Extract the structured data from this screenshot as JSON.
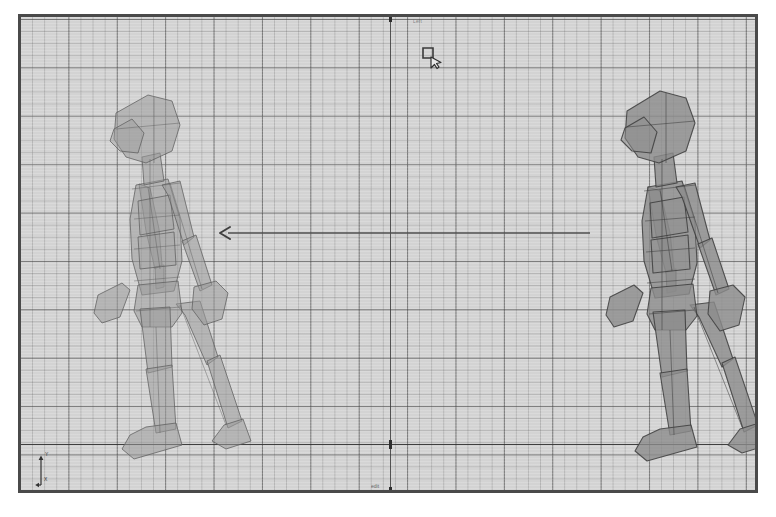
{
  "application": {
    "type": "3d-animation-viewport",
    "view_name": "Left",
    "projection": "orthographic-side"
  },
  "viewport": {
    "label_top": "Left",
    "status_label": "edit",
    "background_color": "#d5d5d5",
    "border_color": "#4a4a4a",
    "grid": {
      "minor_spacing_px": 12,
      "major_spacing_px": 48,
      "minor_color": "#6e6e6e",
      "major_color": "#464646",
      "visible": true
    },
    "axes": {
      "vertical_line_color": "#3b3b3b",
      "ground_line_color": "#2f2f2f",
      "vertical_x_px": 390,
      "ground_y_px": 444
    }
  },
  "gizmo": {
    "name": "axis-orientation-gizmo",
    "axis_y_label": "Y",
    "axis_x_label": "X",
    "color": "#333333"
  },
  "cursor": {
    "name": "lasso-select-cursor",
    "x_px": 420,
    "y_px": 45
  },
  "annotation": {
    "arrow": {
      "name": "motion-direction-arrow",
      "direction": "left",
      "start_x_px": 585,
      "end_x_px": 215,
      "y_px": 235,
      "color": "#4a4a4a"
    }
  },
  "scene_objects": [
    {
      "name": "walk-cycle-figure-start",
      "label": "Character Pose A",
      "position": "left",
      "opacity": "semi-transparent",
      "fill_color": "#9a9a9a",
      "outline_color": "#5f5f5f",
      "pose": "walk-contact"
    },
    {
      "name": "walk-cycle-figure-end",
      "label": "Character Pose B",
      "position": "right",
      "opacity": "opaque",
      "fill_color": "#8b8b8b",
      "outline_color": "#3f3f3f",
      "pose": "walk-contact"
    }
  ]
}
